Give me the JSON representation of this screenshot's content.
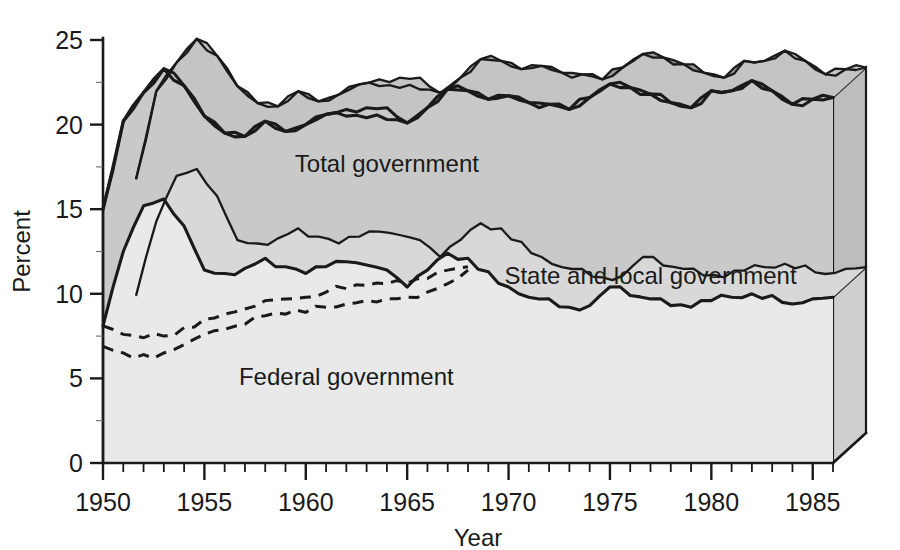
{
  "chart_data": {
    "type": "area",
    "title": "",
    "xlabel": "Year",
    "ylabel": "Percent",
    "xlim": [
      1950,
      1986
    ],
    "ylim": [
      0,
      25
    ],
    "yticks": [
      0,
      5,
      10,
      15,
      20,
      25
    ],
    "xticks": [
      1950,
      1955,
      1960,
      1965,
      1970,
      1975,
      1980,
      1985
    ],
    "x_minor_step": 1,
    "grid": false,
    "legend": "inline-labels",
    "stacked": true,
    "style": "3d-extruded-area",
    "colors": {
      "total_band": "#b6b6b6",
      "total_top_face": "#9a9a9a",
      "state_local_band": "#c9c9c9",
      "federal_band": "#e9e9e9",
      "side_panel": "#a8a8a8",
      "outline": "#1a1a1a",
      "background": "#ffffff"
    },
    "x": [
      1950,
      1951,
      1952,
      1953,
      1954,
      1955,
      1956,
      1957,
      1958,
      1959,
      1960,
      1961,
      1962,
      1963,
      1964,
      1965,
      1966,
      1967,
      1968,
      1969,
      1970,
      1971,
      1972,
      1973,
      1974,
      1975,
      1976,
      1977,
      1978,
      1979,
      1980,
      1981,
      1982,
      1983,
      1984,
      1985,
      1986
    ],
    "series": [
      {
        "name": "Total government",
        "label": "Total government",
        "values": [
          15.0,
          20.2,
          21.9,
          23.3,
          22.3,
          20.5,
          19.5,
          19.3,
          20.2,
          19.6,
          20.0,
          20.6,
          20.5,
          20.4,
          20.3,
          20.1,
          21.0,
          22.1,
          22.0,
          21.5,
          21.7,
          21.3,
          21.2,
          20.9,
          21.6,
          22.4,
          22.2,
          21.8,
          21.3,
          21.0,
          22.0,
          22.0,
          22.6,
          22.0,
          21.2,
          21.5,
          21.6
        ]
      },
      {
        "name": "Federal government",
        "label": "Federal government",
        "values": [
          8.1,
          12.5,
          15.2,
          15.6,
          14.0,
          11.4,
          11.2,
          11.5,
          12.1,
          11.6,
          11.2,
          11.6,
          11.9,
          11.7,
          11.4,
          10.4,
          11.4,
          12.4,
          12.1,
          11.3,
          10.4,
          9.8,
          9.7,
          9.2,
          9.3,
          10.4,
          9.9,
          9.7,
          9.3,
          9.2,
          9.6,
          9.8,
          10.0,
          9.9,
          9.4,
          9.7,
          9.8
        ]
      },
      {
        "name": "State and local government",
        "label": "State and local government",
        "values": [
          6.9,
          7.7,
          6.7,
          7.7,
          8.3,
          9.1,
          8.3,
          7.8,
          8.1,
          8.0,
          8.8,
          9.0,
          9.0,
          9.3,
          9.6,
          9.7,
          9.6,
          9.7,
          9.9,
          10.2,
          11.3,
          11.5,
          11.5,
          11.7,
          12.3,
          12.0,
          12.3,
          12.1,
          12.0,
          11.8,
          12.4,
          12.2,
          12.6,
          12.1,
          11.8,
          11.8,
          11.8
        ]
      }
    ],
    "dashed_overlays": [
      {
        "name": "dashed-upper",
        "x": [
          1950,
          1951,
          1952,
          1953,
          1954,
          1955,
          1956,
          1957,
          1958,
          1959,
          1960,
          1961,
          1962,
          1963,
          1964,
          1965,
          1966,
          1967,
          1968
        ],
        "values": [
          8.1,
          7.6,
          7.4,
          7.5,
          8.0,
          8.5,
          8.8,
          9.1,
          9.6,
          9.7,
          9.8,
          10.1,
          10.3,
          10.5,
          10.6,
          10.6,
          10.9,
          11.4,
          11.6
        ]
      },
      {
        "name": "dashed-lower",
        "x": [
          1950,
          1951,
          1952,
          1953,
          1954,
          1955,
          1956,
          1957,
          1958,
          1959,
          1960,
          1961,
          1962,
          1963,
          1964,
          1965,
          1966,
          1967,
          1968
        ],
        "values": [
          6.9,
          6.5,
          6.4,
          6.5,
          7.0,
          7.6,
          7.9,
          8.2,
          8.7,
          8.8,
          8.9,
          9.2,
          9.4,
          9.6,
          9.7,
          9.8,
          10.1,
          10.6,
          11.4
        ]
      }
    ],
    "annotations": [
      {
        "text": "Total government",
        "x": 1964,
        "y": 17.2
      },
      {
        "text": "State and local government",
        "x": 1977,
        "y": 10.6
      },
      {
        "text": "Federal government",
        "x": 1962,
        "y": 4.6
      }
    ]
  }
}
